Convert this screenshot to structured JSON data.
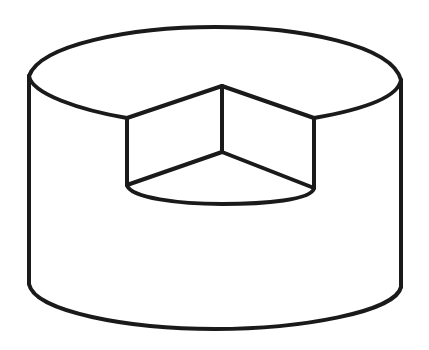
{
  "figure": {
    "stroke_color": "#1a1a1a",
    "background": "#ffffff",
    "stroke_width": 4
  }
}
